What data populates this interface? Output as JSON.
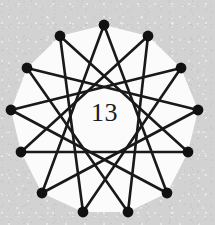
{
  "figure": {
    "kind": "star-polygon",
    "center_label": "13",
    "vertex_count": 13,
    "step": 5,
    "schlafli": "{13/5}",
    "background_color": "#d2d2d2",
    "face_color": "#fbfbfb",
    "line_color": "#191919",
    "vertex_color": "#111111",
    "line_width": 2.6,
    "vertex_radius": 5.4,
    "center_x": 104.5,
    "center_y": 112,
    "radius": 88,
    "start_angle_deg": -90,
    "vertices": [
      {
        "index": 0,
        "x": 104,
        "y": 25
      },
      {
        "index": 1,
        "x": 148,
        "y": 36
      },
      {
        "index": 2,
        "x": 181,
        "y": 68
      },
      {
        "index": 3,
        "x": 198,
        "y": 110
      },
      {
        "index": 4,
        "x": 188,
        "y": 152
      },
      {
        "index": 5,
        "x": 167,
        "y": 193
      },
      {
        "index": 6,
        "x": 128,
        "y": 212
      },
      {
        "index": 7,
        "x": 83,
        "y": 212
      },
      {
        "index": 8,
        "x": 42,
        "y": 193
      },
      {
        "index": 9,
        "x": 21,
        "y": 152
      },
      {
        "index": 10,
        "x": 11,
        "y": 110
      },
      {
        "index": 11,
        "x": 27,
        "y": 68
      },
      {
        "index": 12,
        "x": 60,
        "y": 36
      }
    ]
  }
}
